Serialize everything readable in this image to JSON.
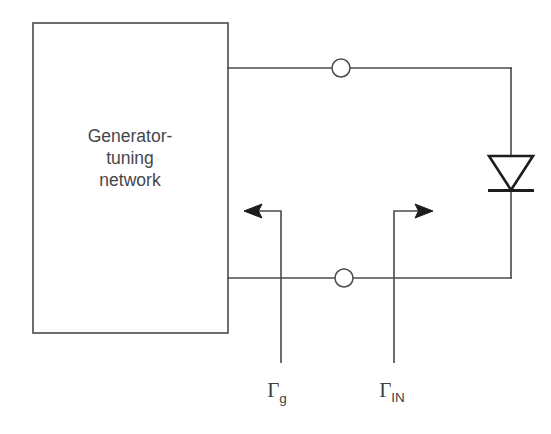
{
  "diagram": {
    "type": "circuit-schematic",
    "background_color": "#ffffff",
    "line_color": "#4a4a4a",
    "symbol_color": "#1d1d1d"
  },
  "block": {
    "name": "generator-tuning-network",
    "label_line1": "Generator-",
    "label_line2": "tuning",
    "label_line3": "network",
    "x": 33,
    "y": 23,
    "width": 195,
    "height": 310
  },
  "component": {
    "name": "diode",
    "symbol": "diode-downward",
    "orientation": "cathode-down",
    "x": 511,
    "y": 172
  },
  "terminals": [
    {
      "name": "top-port-node",
      "x": 341,
      "y": 68,
      "radius": 9
    },
    {
      "name": "bottom-port-node",
      "x": 344,
      "y": 278,
      "radius": 9
    }
  ],
  "reflection_coefficients": [
    {
      "name": "gamma-g",
      "symbol": "Γ",
      "subscript": "g",
      "direction": "left",
      "meaning": "generator reflection coefficient",
      "label_x": 281,
      "label_y": 397,
      "arrow_tip_x": 245,
      "arrow_y": 211
    },
    {
      "name": "gamma-in",
      "symbol": "Γ",
      "subscript": "IN",
      "direction": "right",
      "meaning": "input reflection coefficient",
      "label_x": 397,
      "label_y": 397,
      "arrow_tip_x": 432,
      "arrow_y": 211
    }
  ],
  "wires": {
    "top_rail_y": 68,
    "bottom_rail_y": 278,
    "right_rail_x": 511,
    "left_rail_x": 228
  }
}
